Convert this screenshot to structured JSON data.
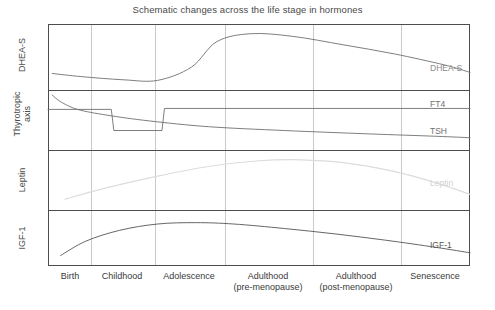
{
  "chart_data": {
    "type": "line",
    "title": "Schematic changes across the life stage in hormones",
    "xlabel": "",
    "ylabel": "",
    "grid": true,
    "legend_position": "inline-right-end-labels",
    "axis_note": "Schematic / qualitative y-axes: no numeric tick labels. Values below are normalized 0-1 relative heights within each stacked panel.",
    "categories": [
      "Birth",
      "Childhood",
      "Adolescence",
      "Adulthood (pre-menopause)",
      "Adulthood (post-menopause)",
      "Senescence"
    ],
    "x": [
      0,
      1,
      2,
      3,
      4,
      5
    ],
    "panels": [
      {
        "axis_label": "DHEA-S",
        "series": [
          {
            "name": "DHEA-S",
            "end_label": "DHEA-S",
            "color": "#6f6f6f",
            "x": [
              0.05,
              0.4,
              0.9,
              1.3,
              1.7,
              2.0,
              2.4,
              2.9,
              3.5,
              4.1,
              4.7,
              5.0
            ],
            "values": [
              0.18,
              0.12,
              0.06,
              0.05,
              0.3,
              0.78,
              0.93,
              0.88,
              0.72,
              0.55,
              0.34,
              0.2
            ]
          }
        ]
      },
      {
        "axis_label": "Thyrotropic axis",
        "series": [
          {
            "name": "FT4",
            "end_label": "FT4",
            "color": "#6f6f6f",
            "x": [
              0.0,
              0.75,
              0.78,
              1.35,
              1.38,
              5.0
            ],
            "values": [
              0.7,
              0.7,
              0.26,
              0.26,
              0.72,
              0.72
            ]
          },
          {
            "name": "TSH",
            "end_label": "TSH",
            "color": "#6f6f6f",
            "x": [
              0.05,
              0.15,
              0.35,
              0.7,
              1.2,
              1.9,
              2.8,
              3.8,
              4.6,
              5.0
            ],
            "values": [
              1.0,
              0.86,
              0.7,
              0.58,
              0.46,
              0.34,
              0.26,
              0.19,
              0.14,
              0.11
            ]
          }
        ]
      },
      {
        "axis_label": "Leptin",
        "series": [
          {
            "name": "Leptin",
            "end_label": "Leptin",
            "color": "#dcdcdc",
            "x": [
              0.2,
              0.7,
              1.3,
              1.9,
              2.5,
              3.0,
              3.5,
              4.1,
              4.6,
              5.0
            ],
            "values": [
              0.08,
              0.32,
              0.56,
              0.76,
              0.88,
              0.9,
              0.84,
              0.66,
              0.42,
              0.18
            ]
          }
        ]
      },
      {
        "axis_label": "IGF-1",
        "series": [
          {
            "name": "IGF-1",
            "end_label": "IGF-1",
            "color": "#555555",
            "x": [
              0.15,
              0.45,
              0.85,
              1.3,
              1.75,
              2.2,
              2.8,
              3.4,
              4.0,
              4.6,
              5.0
            ],
            "values": [
              0.1,
              0.42,
              0.66,
              0.8,
              0.83,
              0.8,
              0.7,
              0.58,
              0.44,
              0.28,
              0.16
            ]
          }
        ]
      }
    ]
  },
  "y_axis_labels": {
    "dhea_s": "DHEA-S",
    "thyrotropic_line1": "Thyrotropic",
    "thyrotropic_line2": "axis",
    "leptin": "Leptin",
    "igf_1": "IGF-1"
  },
  "series_end_labels": {
    "dhea_s": "DHEA-S",
    "ft4": "FT4",
    "tsh": "TSH",
    "leptin": "Leptin",
    "igf_1": "IGF-1"
  },
  "x_axis_labels": [
    {
      "line1": "Birth",
      "line2": ""
    },
    {
      "line1": "Childhood",
      "line2": ""
    },
    {
      "line1": "Adolescence",
      "line2": ""
    },
    {
      "line1": "Adulthood",
      "line2": "(pre-menopause)"
    },
    {
      "line1": "Adulthood",
      "line2": "(post-menopause)"
    },
    {
      "line1": "Senescence",
      "line2": ""
    }
  ],
  "colors": {
    "frame": "#4d4d4d",
    "grid": "#c9c9c9",
    "curve_dark": "#555555",
    "curve_mid": "#6f6f6f",
    "curve_light": "#dcdcdc",
    "text": "#3a3a3a",
    "background": "#ffffff"
  }
}
